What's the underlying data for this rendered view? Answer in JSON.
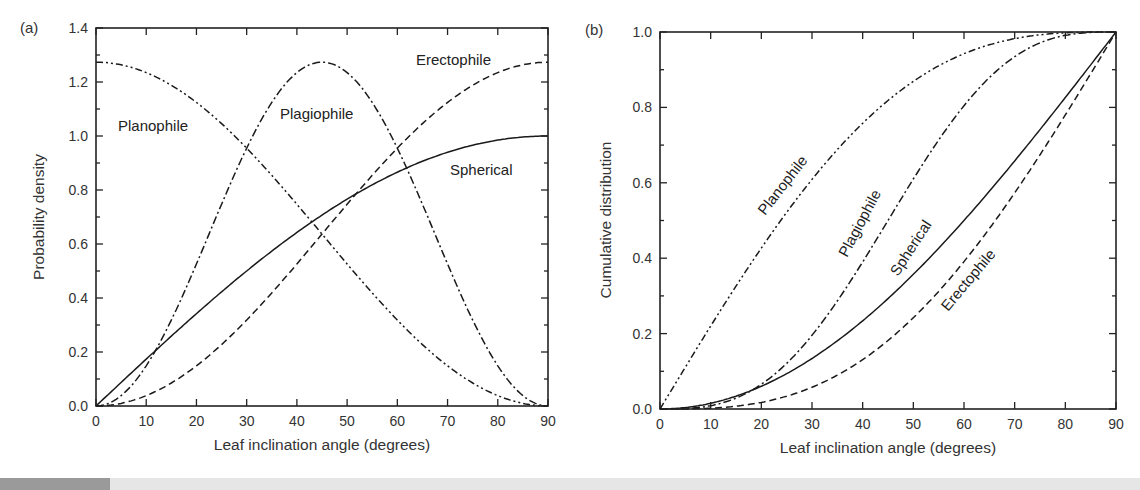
{
  "chart_data": [
    {
      "type": "line",
      "panel_label": "(a)",
      "title": "",
      "xlabel": "Leaf inclination angle (degrees)",
      "ylabel": "Probability density",
      "xlim": [
        0,
        90
      ],
      "ylim": [
        0,
        1.4
      ],
      "xticks": [
        "0",
        "10",
        "20",
        "30",
        "40",
        "50",
        "60",
        "70",
        "80",
        "90"
      ],
      "yticks": [
        "0.0",
        "0.2",
        "0.4",
        "0.6",
        "0.8",
        "1.0",
        "1.2",
        "1.4"
      ],
      "grid": false,
      "legend": "inline labels",
      "x": [
        0,
        5,
        10,
        15,
        20,
        25,
        30,
        35,
        40,
        45,
        50,
        55,
        60,
        65,
        70,
        75,
        80,
        85,
        90
      ],
      "series": [
        {
          "name": "Planophile",
          "style": "dash-dot-dot",
          "values": [
            1.273,
            1.254,
            1.197,
            1.103,
            0.975,
            0.818,
            0.637,
            0.455,
            0.298,
            0.0,
            0.0,
            0.0,
            0.0,
            0.0,
            0.0,
            0.0,
            0.0,
            0.0,
            0.0
          ]
        },
        {
          "name": "Erectophile",
          "style": "dashed",
          "values": [
            0.0,
            0.019,
            0.077,
            0.171,
            0.298,
            0.455,
            0.637,
            0.818,
            0.975,
            1.103,
            1.197,
            1.254,
            1.273,
            0,
            0,
            0,
            0,
            0,
            0
          ]
        },
        {
          "name": "Plagiophile",
          "style": "dash-dot",
          "values": [
            0.0,
            0.077,
            0.298,
            0.637,
            0.975,
            1.197,
            1.273,
            1.197,
            0.975,
            0.637,
            0.298,
            0.077,
            0.0,
            0,
            0,
            0,
            0,
            0,
            0
          ]
        },
        {
          "name": "Spherical",
          "style": "solid",
          "values": [
            0.0,
            0.087,
            0.174,
            0.259,
            0.342,
            0.423,
            0.5,
            0.574,
            0.643,
            0.707,
            0.766,
            0.819,
            0.866,
            0.906,
            0.94,
            0.966,
            0.985,
            0.996,
            1.0
          ]
        }
      ],
      "annotations": [
        {
          "text": "Planophile",
          "x": 12,
          "y": 1.0
        },
        {
          "text": "Plagiophile",
          "x": 45,
          "y": 1.02
        },
        {
          "text": "Erectophile",
          "x": 76,
          "y": 1.27
        },
        {
          "text": "Spherical",
          "x": 80,
          "y": 0.8
        }
      ]
    },
    {
      "type": "line",
      "panel_label": "(b)",
      "title": "",
      "xlabel": "Leaf inclination angle (degrees)",
      "ylabel": "Cumulative distribution",
      "xlim": [
        0,
        90
      ],
      "ylim": [
        0,
        1.0
      ],
      "xticks": [
        "0",
        "10",
        "20",
        "30",
        "40",
        "50",
        "60",
        "70",
        "80",
        "90"
      ],
      "yticks": [
        "0.0",
        "0.2",
        "0.4",
        "0.6",
        "0.8",
        "1.0"
      ],
      "grid": false,
      "legend": "inline labels (rotated)",
      "x": [
        0,
        10,
        20,
        30,
        40,
        50,
        60,
        70,
        80,
        90
      ],
      "series": [
        {
          "name": "Planophile",
          "style": "dash-dot-dot",
          "values": [
            0.0,
            0.217,
            0.418,
            0.609,
            0.765,
            0.883,
            0.958,
            0.994,
            1.0,
            1.0
          ]
        },
        {
          "name": "Plagiophile",
          "style": "dash-dot",
          "values": [
            0.0,
            0.013,
            0.067,
            0.196,
            0.384,
            0.616,
            0.804,
            0.933,
            0.987,
            1.0
          ]
        },
        {
          "name": "Spherical",
          "style": "solid",
          "values": [
            0.0,
            0.015,
            0.06,
            0.134,
            0.234,
            0.357,
            0.5,
            0.658,
            0.826,
            1.0
          ]
        },
        {
          "name": "Erectophile",
          "style": "dashed",
          "values": [
            0.0,
            0.004,
            0.027,
            0.091,
            0.209,
            0.373,
            0.569,
            0.765,
            0.919,
            1.0
          ]
        }
      ],
      "annotations": [
        {
          "text": "Planophile",
          "rotation": -52
        },
        {
          "text": "Plagiophile",
          "rotation": -60
        },
        {
          "text": "Spherical",
          "rotation": -55
        },
        {
          "text": "Erectophile",
          "rotation": -48
        }
      ]
    }
  ]
}
